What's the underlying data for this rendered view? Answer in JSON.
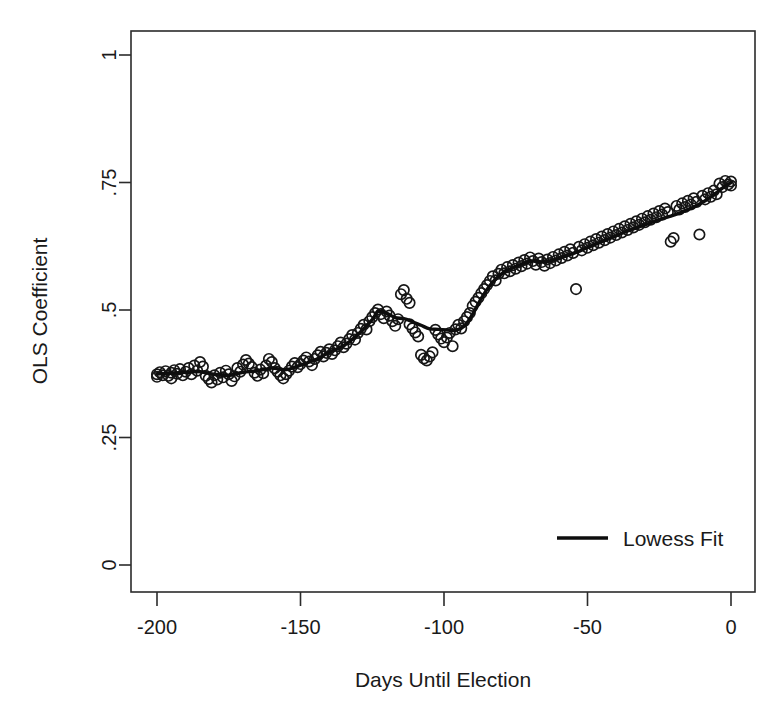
{
  "chart_data": {
    "type": "scatter",
    "title": "",
    "xlabel": "Days Until Election",
    "ylabel": "OLS Coefficient",
    "xlim": [
      -205,
      3
    ],
    "ylim": [
      0,
      1
    ],
    "xticks": [
      -200,
      -150,
      -100,
      -50,
      0
    ],
    "xtick_labels": [
      "-200",
      "-150",
      "-100",
      "-50",
      "0"
    ],
    "yticks": [
      0,
      0.25,
      0.5,
      0.75,
      1
    ],
    "ytick_labels": [
      "0",
      ".25",
      ".5",
      ".75",
      "1"
    ],
    "grid": false,
    "legend_position": "lower right",
    "legend": [
      {
        "name": "Lowess Fit",
        "marker": "line",
        "color": "#0d0d0d"
      }
    ],
    "series": [
      {
        "name": "OLS coefficient estimates",
        "type": "scatter",
        "marker": "open-circle",
        "color": "#161616",
        "points": [
          [
            -200,
            0.374
          ],
          [
            -200,
            0.369
          ],
          [
            -199,
            0.378
          ],
          [
            -198,
            0.372
          ],
          [
            -197,
            0.38
          ],
          [
            -196,
            0.371
          ],
          [
            -195,
            0.377
          ],
          [
            -195,
            0.366
          ],
          [
            -194,
            0.382
          ],
          [
            -193,
            0.375
          ],
          [
            -192,
            0.384
          ],
          [
            -191,
            0.372
          ],
          [
            -190,
            0.379
          ],
          [
            -189,
            0.386
          ],
          [
            -188,
            0.374
          ],
          [
            -187,
            0.391
          ],
          [
            -186,
            0.381
          ],
          [
            -185,
            0.398
          ],
          [
            -184,
            0.389
          ],
          [
            -183,
            0.371
          ],
          [
            -182,
            0.365
          ],
          [
            -181,
            0.358
          ],
          [
            -180,
            0.372
          ],
          [
            -179,
            0.364
          ],
          [
            -178,
            0.377
          ],
          [
            -177,
            0.368
          ],
          [
            -176,
            0.381
          ],
          [
            -175,
            0.374
          ],
          [
            -174,
            0.361
          ],
          [
            -173,
            0.37
          ],
          [
            -172,
            0.386
          ],
          [
            -171,
            0.379
          ],
          [
            -170,
            0.393
          ],
          [
            -169,
            0.402
          ],
          [
            -168,
            0.395
          ],
          [
            -167,
            0.388
          ],
          [
            -166,
            0.377
          ],
          [
            -165,
            0.371
          ],
          [
            -164,
            0.383
          ],
          [
            -163,
            0.376
          ],
          [
            -162,
            0.391
          ],
          [
            -161,
            0.404
          ],
          [
            -160,
            0.398
          ],
          [
            -159,
            0.386
          ],
          [
            -158,
            0.379
          ],
          [
            -157,
            0.372
          ],
          [
            -156,
            0.366
          ],
          [
            -155,
            0.374
          ],
          [
            -154,
            0.381
          ],
          [
            -153,
            0.389
          ],
          [
            -152,
            0.396
          ],
          [
            -151,
            0.388
          ],
          [
            -150,
            0.394
          ],
          [
            -149,
            0.401
          ],
          [
            -148,
            0.407
          ],
          [
            -147,
            0.399
          ],
          [
            -146,
            0.392
          ],
          [
            -145,
            0.404
          ],
          [
            -144,
            0.411
          ],
          [
            -143,
            0.418
          ],
          [
            -142,
            0.409
          ],
          [
            -141,
            0.416
          ],
          [
            -140,
            0.423
          ],
          [
            -139,
            0.414
          ],
          [
            -138,
            0.421
          ],
          [
            -137,
            0.429
          ],
          [
            -136,
            0.436
          ],
          [
            -135,
            0.427
          ],
          [
            -134,
            0.434
          ],
          [
            -133,
            0.443
          ],
          [
            -132,
            0.451
          ],
          [
            -131,
            0.442
          ],
          [
            -130,
            0.455
          ],
          [
            -129,
            0.463
          ],
          [
            -128,
            0.471
          ],
          [
            -127,
            0.462
          ],
          [
            -126,
            0.478
          ],
          [
            -125,
            0.486
          ],
          [
            -124,
            0.494
          ],
          [
            -123,
            0.501
          ],
          [
            -122,
            0.492
          ],
          [
            -121,
            0.484
          ],
          [
            -120,
            0.497
          ],
          [
            -119,
            0.489
          ],
          [
            -118,
            0.478
          ],
          [
            -117,
            0.469
          ],
          [
            -116,
            0.482
          ],
          [
            -115,
            0.531
          ],
          [
            -114,
            0.539
          ],
          [
            -113,
            0.522
          ],
          [
            -112,
            0.514
          ],
          [
            -112,
            0.472
          ],
          [
            -111,
            0.464
          ],
          [
            -110,
            0.456
          ],
          [
            -109,
            0.448
          ],
          [
            -108,
            0.412
          ],
          [
            -107,
            0.405
          ],
          [
            -106,
            0.401
          ],
          [
            -105,
            0.409
          ],
          [
            -104,
            0.417
          ],
          [
            -103,
            0.461
          ],
          [
            -102,
            0.452
          ],
          [
            -101,
            0.444
          ],
          [
            -100,
            0.437
          ],
          [
            -99,
            0.446
          ],
          [
            -98,
            0.455
          ],
          [
            -97,
            0.429
          ],
          [
            -96,
            0.462
          ],
          [
            -95,
            0.471
          ],
          [
            -94,
            0.464
          ],
          [
            -93,
            0.478
          ],
          [
            -92,
            0.486
          ],
          [
            -91,
            0.494
          ],
          [
            -90,
            0.508
          ],
          [
            -89,
            0.516
          ],
          [
            -88,
            0.524
          ],
          [
            -87,
            0.533
          ],
          [
            -86,
            0.541
          ],
          [
            -85,
            0.549
          ],
          [
            -84,
            0.557
          ],
          [
            -83,
            0.566
          ],
          [
            -82,
            0.558
          ],
          [
            -81,
            0.571
          ],
          [
            -80,
            0.579
          ],
          [
            -79,
            0.572
          ],
          [
            -78,
            0.584
          ],
          [
            -77,
            0.576
          ],
          [
            -76,
            0.588
          ],
          [
            -75,
            0.581
          ],
          [
            -74,
            0.593
          ],
          [
            -73,
            0.586
          ],
          [
            -72,
            0.598
          ],
          [
            -71,
            0.591
          ],
          [
            -70,
            0.603
          ],
          [
            -69,
            0.596
          ],
          [
            -68,
            0.589
          ],
          [
            -67,
            0.601
          ],
          [
            -66,
            0.594
          ],
          [
            -65,
            0.587
          ],
          [
            -64,
            0.599
          ],
          [
            -63,
            0.592
          ],
          [
            -62,
            0.604
          ],
          [
            -61,
            0.597
          ],
          [
            -60,
            0.609
          ],
          [
            -59,
            0.602
          ],
          [
            -58,
            0.614
          ],
          [
            -57,
            0.607
          ],
          [
            -56,
            0.619
          ],
          [
            -55,
            0.612
          ],
          [
            -54,
            0.541
          ],
          [
            -53,
            0.624
          ],
          [
            -52,
            0.617
          ],
          [
            -51,
            0.629
          ],
          [
            -50,
            0.622
          ],
          [
            -49,
            0.634
          ],
          [
            -48,
            0.627
          ],
          [
            -47,
            0.639
          ],
          [
            -46,
            0.632
          ],
          [
            -45,
            0.644
          ],
          [
            -44,
            0.637
          ],
          [
            -43,
            0.649
          ],
          [
            -42,
            0.642
          ],
          [
            -41,
            0.654
          ],
          [
            -40,
            0.647
          ],
          [
            -39,
            0.659
          ],
          [
            -38,
            0.652
          ],
          [
            -37,
            0.664
          ],
          [
            -36,
            0.657
          ],
          [
            -35,
            0.669
          ],
          [
            -34,
            0.662
          ],
          [
            -33,
            0.674
          ],
          [
            -32,
            0.667
          ],
          [
            -31,
            0.679
          ],
          [
            -30,
            0.672
          ],
          [
            -29,
            0.684
          ],
          [
            -28,
            0.677
          ],
          [
            -27,
            0.689
          ],
          [
            -26,
            0.682
          ],
          [
            -25,
            0.694
          ],
          [
            -24,
            0.687
          ],
          [
            -23,
            0.699
          ],
          [
            -22,
            0.692
          ],
          [
            -21,
            0.634
          ],
          [
            -20,
            0.641
          ],
          [
            -19,
            0.704
          ],
          [
            -18,
            0.697
          ],
          [
            -17,
            0.709
          ],
          [
            -16,
            0.702
          ],
          [
            -15,
            0.714
          ],
          [
            -14,
            0.707
          ],
          [
            -13,
            0.719
          ],
          [
            -12,
            0.712
          ],
          [
            -11,
            0.648
          ],
          [
            -10,
            0.724
          ],
          [
            -9,
            0.717
          ],
          [
            -8,
            0.729
          ],
          [
            -7,
            0.722
          ],
          [
            -6,
            0.734
          ],
          [
            -5,
            0.727
          ],
          [
            -4,
            0.748
          ],
          [
            -3,
            0.741
          ],
          [
            -2,
            0.753
          ],
          [
            -1,
            0.746
          ],
          [
            0,
            0.752
          ],
          [
            0,
            0.744
          ]
        ]
      },
      {
        "name": "Lowess Fit",
        "type": "line",
        "color": "#0d0d0d",
        "points": [
          [
            -200,
            0.375
          ],
          [
            -195,
            0.376
          ],
          [
            -190,
            0.378
          ],
          [
            -185,
            0.379
          ],
          [
            -180,
            0.374
          ],
          [
            -175,
            0.372
          ],
          [
            -170,
            0.378
          ],
          [
            -165,
            0.381
          ],
          [
            -160,
            0.386
          ],
          [
            -155,
            0.383
          ],
          [
            -150,
            0.392
          ],
          [
            -145,
            0.402
          ],
          [
            -140,
            0.417
          ],
          [
            -135,
            0.43
          ],
          [
            -130,
            0.452
          ],
          [
            -125,
            0.481
          ],
          [
            -123,
            0.497
          ],
          [
            -120,
            0.494
          ],
          [
            -117,
            0.485
          ],
          [
            -114,
            0.483
          ],
          [
            -111,
            0.477
          ],
          [
            -108,
            0.47
          ],
          [
            -105,
            0.463
          ],
          [
            -102,
            0.462
          ],
          [
            -99,
            0.461
          ],
          [
            -96,
            0.46
          ],
          [
            -93,
            0.468
          ],
          [
            -90,
            0.492
          ],
          [
            -87,
            0.523
          ],
          [
            -84,
            0.548
          ],
          [
            -81,
            0.566
          ],
          [
            -78,
            0.578
          ],
          [
            -75,
            0.585
          ],
          [
            -72,
            0.592
          ],
          [
            -69,
            0.596
          ],
          [
            -66,
            0.594
          ],
          [
            -63,
            0.596
          ],
          [
            -60,
            0.601
          ],
          [
            -57,
            0.607
          ],
          [
            -54,
            0.613
          ],
          [
            -51,
            0.62
          ],
          [
            -48,
            0.627
          ],
          [
            -45,
            0.634
          ],
          [
            -42,
            0.641
          ],
          [
            -39,
            0.648
          ],
          [
            -36,
            0.655
          ],
          [
            -33,
            0.661
          ],
          [
            -30,
            0.667
          ],
          [
            -27,
            0.673
          ],
          [
            -24,
            0.679
          ],
          [
            -21,
            0.684
          ],
          [
            -18,
            0.69
          ],
          [
            -15,
            0.697
          ],
          [
            -12,
            0.705
          ],
          [
            -9,
            0.714
          ],
          [
            -6,
            0.726
          ],
          [
            -3,
            0.739
          ],
          [
            0,
            0.75
          ]
        ]
      }
    ]
  },
  "axes": {
    "plot_box": {
      "left": 131,
      "top": 31,
      "right": 755,
      "bottom": 592
    }
  }
}
